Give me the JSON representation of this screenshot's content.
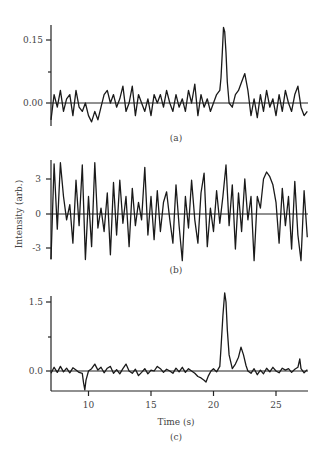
{
  "chart_data": [
    {
      "type": "line",
      "panel": "(a)",
      "title": "",
      "xlabel": "",
      "ylabel": "",
      "xlim": [
        7.0,
        27.5
      ],
      "ylim": [
        -0.055,
        0.19
      ],
      "yticks": [
        {
          "value": 0.15,
          "label": "0.15"
        },
        {
          "value": 0.075,
          "label": ""
        },
        {
          "value": 0.0,
          "label": "0.00"
        }
      ],
      "grid": false,
      "zero_line": true,
      "annotations": [
        "sharp peak ~0.18 at t≈20.8 s",
        "secondary bump ~0.07 at t≈22.2 s"
      ],
      "x": [
        7.0,
        7.25,
        7.5,
        7.75,
        8.0,
        8.25,
        8.5,
        8.75,
        9.0,
        9.25,
        9.5,
        9.75,
        10.0,
        10.25,
        10.5,
        10.75,
        11.0,
        11.25,
        11.5,
        11.75,
        12.0,
        12.25,
        12.5,
        12.75,
        13.0,
        13.25,
        13.5,
        13.75,
        14.0,
        14.25,
        14.5,
        14.75,
        15.0,
        15.25,
        15.5,
        15.75,
        16.0,
        16.25,
        16.5,
        16.75,
        17.0,
        17.25,
        17.5,
        17.75,
        18.0,
        18.25,
        18.5,
        18.75,
        19.0,
        19.25,
        19.5,
        19.75,
        20.0,
        20.25,
        20.5,
        20.6,
        20.7,
        20.8,
        20.9,
        21.0,
        21.1,
        21.25,
        21.5,
        21.75,
        22.0,
        22.25,
        22.5,
        22.75,
        23.0,
        23.25,
        23.5,
        23.75,
        24.0,
        24.25,
        24.5,
        24.75,
        25.0,
        25.25,
        25.5,
        25.75,
        26.0,
        26.25,
        26.5,
        26.75,
        27.0,
        27.25,
        27.5
      ],
      "values": [
        -0.04,
        0.02,
        -0.01,
        0.03,
        -0.02,
        0.01,
        0.02,
        -0.03,
        0.03,
        -0.01,
        -0.02,
        0.0,
        -0.03,
        -0.045,
        -0.02,
        -0.04,
        -0.01,
        0.02,
        0.03,
        0.0,
        0.02,
        -0.01,
        0.01,
        0.04,
        -0.02,
        0.0,
        0.04,
        -0.03,
        0.02,
        0.0,
        -0.02,
        0.01,
        -0.03,
        0.02,
        0.0,
        0.02,
        -0.01,
        0.03,
        0.0,
        -0.02,
        0.02,
        -0.01,
        0.01,
        -0.02,
        0.03,
        0.0,
        0.045,
        -0.03,
        0.02,
        -0.01,
        0.01,
        -0.02,
        0.0,
        0.02,
        0.03,
        0.06,
        0.12,
        0.18,
        0.17,
        0.12,
        0.05,
        0.0,
        -0.01,
        0.02,
        0.03,
        0.05,
        0.07,
        0.03,
        -0.03,
        0.01,
        -0.035,
        0.02,
        -0.02,
        0.03,
        -0.01,
        0.01,
        -0.03,
        0.02,
        -0.02,
        0.03,
        0.0,
        -0.02,
        0.02,
        0.04,
        -0.01,
        -0.03,
        -0.02
      ]
    },
    {
      "type": "line",
      "panel": "(b)",
      "title": "",
      "xlabel": "",
      "ylabel": "Intensity (arb.)",
      "xlim": [
        7.0,
        27.5
      ],
      "ylim": [
        -4.2,
        4.6
      ],
      "yticks": [
        {
          "value": 3,
          "label": "3"
        },
        {
          "value": 0,
          "label": "0"
        },
        {
          "value": -3,
          "label": "-3"
        }
      ],
      "grid": false,
      "zero_line": true,
      "annotations": [
        "broad elevated region ~3.3 near t≈22.5 s"
      ],
      "x": [
        7.0,
        7.25,
        7.5,
        7.75,
        8.0,
        8.25,
        8.5,
        8.75,
        9.0,
        9.25,
        9.5,
        9.75,
        10.0,
        10.25,
        10.5,
        10.75,
        11.0,
        11.25,
        11.5,
        11.75,
        12.0,
        12.25,
        12.5,
        12.75,
        13.0,
        13.25,
        13.5,
        13.75,
        14.0,
        14.25,
        14.5,
        14.75,
        15.0,
        15.25,
        15.5,
        15.75,
        16.0,
        16.25,
        16.5,
        16.75,
        17.0,
        17.25,
        17.5,
        17.75,
        18.0,
        18.25,
        18.5,
        18.75,
        19.0,
        19.25,
        19.5,
        19.75,
        20.0,
        20.25,
        20.5,
        20.75,
        21.0,
        21.25,
        21.5,
        21.75,
        22.0,
        22.25,
        22.5,
        22.75,
        23.0,
        23.25,
        23.5,
        23.75,
        24.0,
        24.25,
        24.5,
        24.75,
        25.0,
        25.25,
        25.5,
        25.75,
        26.0,
        26.25,
        26.5,
        26.75,
        27.0,
        27.25,
        27.5
      ],
      "values": [
        -3.9,
        4.3,
        -1.3,
        4.4,
        1.5,
        -0.5,
        0.8,
        -2.5,
        2.9,
        -1.0,
        4.2,
        -3.9,
        1.5,
        -2.8,
        4.4,
        -1.2,
        0.5,
        -1.5,
        1.8,
        -3.5,
        2.7,
        -1.8,
        2.9,
        -0.8,
        1.5,
        -2.8,
        2.2,
        -1.0,
        1.0,
        -0.5,
        4.0,
        -1.8,
        1.5,
        -2.2,
        2.0,
        -1.5,
        1.0,
        1.9,
        -0.5,
        -2.5,
        2.5,
        -1.0,
        -4.0,
        1.5,
        -1.2,
        2.9,
        -0.5,
        -2.5,
        1.8,
        3.5,
        -2.8,
        0.5,
        -1.5,
        2.0,
        -0.8,
        1.5,
        4.2,
        -1.0,
        2.5,
        -3.0,
        1.8,
        -1.5,
        3.0,
        -0.5,
        1.5,
        -4.0,
        1.5,
        0.5,
        3.0,
        3.6,
        3.2,
        2.5,
        1.0,
        -2.5,
        2.2,
        -1.0,
        1.5,
        -3.0,
        2.8,
        -1.8,
        -4.0,
        2.0,
        -2.0,
        1.5,
        -2.5,
        4.3,
        -3.5
      ]
    },
    {
      "type": "line",
      "panel": "(c)",
      "title": "",
      "xlabel": "Time (s)",
      "ylabel": "",
      "xlim": [
        7.0,
        27.5
      ],
      "ylim": [
        -0.6,
        1.75
      ],
      "xticks": [
        {
          "value": 10,
          "label": "10"
        },
        {
          "value": 15,
          "label": "15"
        },
        {
          "value": 20,
          "label": "20"
        },
        {
          "value": 25,
          "label": "25"
        }
      ],
      "yticks": [
        {
          "value": 1.5,
          "label": "1.5"
        },
        {
          "value": 0.75,
          "label": ""
        },
        {
          "value": 0.0,
          "label": "0.0"
        }
      ],
      "grid": false,
      "zero_line": true,
      "annotations": [
        "dip ~-0.41 at t≈9.7 s",
        "dip ~-0.24 at t≈19.4 s",
        "main peak ~1.70 at t≈20.9 s",
        "secondary peak ~0.52 at t≈22.2 s",
        "small bump ~0.26 at t≈26.9 s"
      ],
      "x": [
        7.0,
        7.25,
        7.5,
        7.75,
        8.0,
        8.25,
        8.5,
        8.75,
        9.0,
        9.25,
        9.5,
        9.6,
        9.7,
        9.8,
        10.0,
        10.25,
        10.5,
        10.75,
        11.0,
        11.25,
        11.5,
        11.75,
        12.0,
        12.25,
        12.5,
        12.75,
        13.0,
        13.25,
        13.5,
        13.75,
        14.0,
        14.25,
        14.5,
        14.75,
        15.0,
        15.25,
        15.5,
        15.75,
        16.0,
        16.25,
        16.5,
        16.75,
        17.0,
        17.25,
        17.5,
        17.75,
        18.0,
        18.25,
        18.5,
        18.75,
        19.0,
        19.25,
        19.4,
        19.6,
        19.8,
        20.0,
        20.25,
        20.5,
        20.6,
        20.75,
        20.9,
        21.0,
        21.1,
        21.25,
        21.5,
        21.75,
        22.0,
        22.2,
        22.4,
        22.6,
        22.75,
        23.0,
        23.25,
        23.5,
        23.75,
        24.0,
        24.25,
        24.5,
        24.75,
        25.0,
        25.25,
        25.5,
        25.75,
        26.0,
        26.25,
        26.5,
        26.75,
        26.9,
        27.0,
        27.25,
        27.5
      ],
      "values": [
        -0.05,
        0.08,
        -0.03,
        0.1,
        -0.02,
        0.06,
        -0.04,
        0.07,
        0.02,
        -0.03,
        -0.05,
        -0.25,
        -0.41,
        -0.2,
        0.0,
        0.05,
        0.15,
        0.02,
        0.08,
        -0.04,
        0.06,
        0.1,
        -0.05,
        0.03,
        -0.06,
        0.05,
        0.15,
        0.0,
        -0.05,
        0.04,
        -0.1,
        -0.03,
        0.05,
        -0.06,
        0.02,
        0.0,
        0.1,
        0.05,
        -0.03,
        0.04,
        0.0,
        -0.05,
        0.06,
        -0.02,
        0.08,
        -0.03,
        0.05,
        0.0,
        -0.05,
        -0.12,
        -0.15,
        -0.2,
        -0.24,
        -0.1,
        0.0,
        0.05,
        -0.02,
        0.1,
        0.5,
        1.2,
        1.7,
        1.5,
        0.9,
        0.35,
        0.05,
        0.15,
        0.3,
        0.52,
        0.35,
        0.12,
        0.0,
        -0.05,
        0.05,
        -0.08,
        0.02,
        -0.06,
        0.06,
        -0.02,
        0.08,
        0.0,
        -0.04,
        0.06,
        0.02,
        0.05,
        -0.03,
        0.04,
        0.08,
        0.26,
        0.05,
        -0.04,
        0.03
      ]
    }
  ],
  "labels": {
    "panel_a": "(a)",
    "panel_b": "(b)",
    "panel_c": "(c)",
    "y_axis_title": "Intensity (arb.)",
    "x_axis_title": "Time (s)"
  },
  "colors": {
    "trace": "#1a1a1a",
    "axis": "#222222",
    "text": "#444444",
    "background": "#ffffff"
  }
}
